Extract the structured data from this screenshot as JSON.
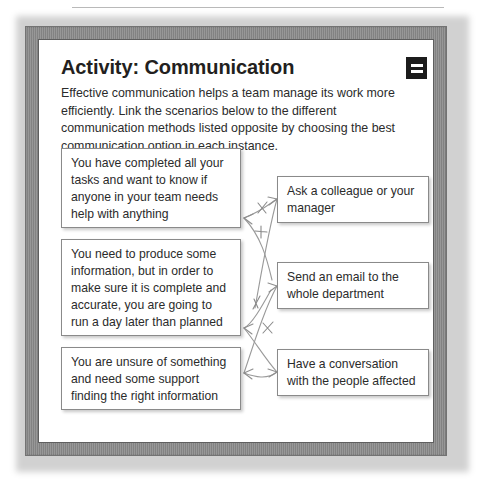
{
  "page": {
    "title": "Activity: Communication",
    "intro": "Effective communication helps a team manage its work more efficiently. Link the scenarios below to the different communication methods listed opposite by choosing the best communication option in each instance.",
    "menu_icon": "equals-menu-icon"
  },
  "scenarios": [
    {
      "id": "L1",
      "text": "You have completed all your tasks and want to know if anyone in your team needs help with anything"
    },
    {
      "id": "L2",
      "text": "You need to produce some information, but in order to make sure it is complete and accurate, you are going to run a day later than planned"
    },
    {
      "id": "L3",
      "text": "You are unsure of something and need some support finding the right information"
    }
  ],
  "methods": [
    {
      "id": "R1",
      "text": "Ask a colleague or your manager"
    },
    {
      "id": "R2",
      "text": "Send an email to the whole department"
    },
    {
      "id": "R3",
      "text": "Have a conversation with the people affected"
    }
  ],
  "connections": [
    {
      "from": "L1",
      "to": "R1"
    },
    {
      "from": "L2",
      "to": "R3"
    },
    {
      "from": "L3",
      "to": "R2"
    }
  ],
  "colors": {
    "frame": "#a6a6a6",
    "page": "#ffffff",
    "text": "#2b2b2b",
    "heading": "#231f20",
    "box_border": "#8a8a8a",
    "connector": "#9a9a9a",
    "icon_background": "#1c1c1c"
  }
}
